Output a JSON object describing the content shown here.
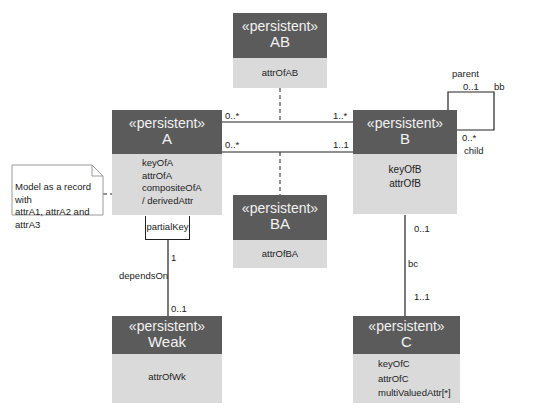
{
  "diagram": {
    "type": "UML class diagram",
    "classes": {
      "AB": {
        "stereotype": "«persistent»",
        "name": "AB",
        "attributes": [
          "attrOfAB"
        ]
      },
      "A": {
        "stereotype": "«persistent»",
        "name": "A",
        "attributes": [
          "keyOfA",
          "attrOfA",
          "compositeOfA",
          "/ derivedAttr"
        ]
      },
      "B": {
        "stereotype": "«persistent»",
        "name": "B",
        "attributes": [
          "keyOfB",
          "attrOfB"
        ]
      },
      "BA": {
        "stereotype": "«persistent»",
        "name": "BA",
        "attributes": [
          "attrOfBA"
        ]
      },
      "Weak": {
        "stereotype": "«persistent»",
        "name": "Weak",
        "attributes": [
          "attrOfWk"
        ]
      },
      "C": {
        "stereotype": "«persistent»",
        "name": "C",
        "attributes": [
          "keyOfC",
          "attrOfC",
          "multiValuedAttr[*]"
        ]
      }
    },
    "note": {
      "line1": "Model as a record with",
      "line2": "attrA1, attrA2 and attrA3"
    },
    "qualifier": {
      "label": "partialKey"
    },
    "associations": {
      "ab": {
        "a_mult": "0..*",
        "b_mult": "1..*"
      },
      "ba": {
        "a_mult": "0..*",
        "b_mult": "1..1"
      },
      "bb": {
        "name": "bb",
        "parent_role": "parent",
        "parent_mult": "0..1",
        "child_mult": "0..*",
        "child_role": "child"
      },
      "bc": {
        "name": "bc",
        "b_mult": "0..1",
        "c_mult": "1..1"
      },
      "dependsOn": {
        "name": "dependsOn",
        "a_mult": "1",
        "weak_mult": "0..1"
      }
    }
  }
}
